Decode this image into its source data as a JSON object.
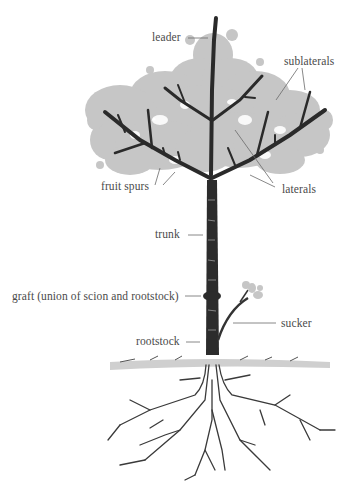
{
  "diagram": {
    "colors": {
      "foliage": "#c4c4c4",
      "bark": "#2a2a2a",
      "label_text": "#4a4a4a",
      "leader_lines": "#6a6a6a",
      "ground": "#cfcfcf",
      "background": "#ffffff"
    },
    "labels": {
      "leader": "leader",
      "sublaterals": "sublaterals",
      "fruit_spurs": "fruit spurs",
      "laterals": "laterals",
      "trunk": "trunk",
      "graft": "graft (union of scion and rootstock)",
      "sucker": "sucker",
      "rootstock": "rootstock"
    }
  }
}
